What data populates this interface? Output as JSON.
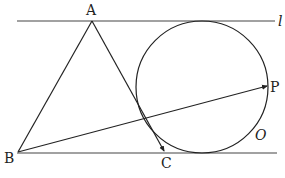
{
  "diagram": {
    "type": "geometry",
    "lines": {
      "top_line": {
        "label": "l",
        "y": 21,
        "x1": 17,
        "x2": 275
      },
      "bottom_line": {
        "y": 153,
        "x1": 17,
        "x2": 277
      }
    },
    "points": {
      "A": {
        "label": "A",
        "x": 92,
        "y": 21,
        "label_x": 86,
        "label_y": 15
      },
      "B": {
        "label": "B",
        "x": 18,
        "y": 152,
        "label_x": 4,
        "label_y": 163
      },
      "C": {
        "label": "C",
        "x": 164,
        "y": 152,
        "label_x": 161,
        "label_y": 168
      },
      "P": {
        "label": "P",
        "x": 267,
        "y": 86,
        "label_x": 270,
        "label_y": 92
      }
    },
    "circle": {
      "label": "O",
      "cx": 202,
      "cy": 87,
      "r": 66,
      "label_x": 255,
      "label_y": 140
    },
    "segments": [
      {
        "from": "A",
        "to": "B"
      },
      {
        "from": "A",
        "to": "C",
        "arrow": true
      },
      {
        "from": "B",
        "to": "P",
        "arrow": true
      }
    ],
    "colors": {
      "stroke": "#222222",
      "line": "#444444",
      "background": "#ffffff"
    }
  }
}
